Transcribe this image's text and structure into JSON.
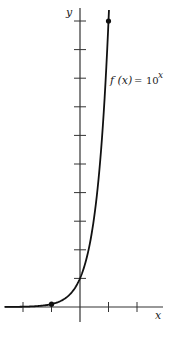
{
  "chart_data": {
    "type": "line",
    "title": "",
    "function_label": "f(x) = 10^x",
    "function_label_parts": {
      "lhs": "f (x)",
      "eq": "=",
      "base": "10",
      "exp": "x"
    },
    "xlabel": "x",
    "ylabel": "y",
    "xlim": [
      -2.6,
      2.9
    ],
    "ylim": [
      -0.5,
      10.5
    ],
    "x_ticks": [
      -2,
      -1,
      1,
      2
    ],
    "y_ticks": [
      1,
      2,
      3,
      4,
      5,
      6,
      7,
      8,
      9,
      10
    ],
    "tick_labels_shown": false,
    "grid": false,
    "legend": "none",
    "series": [
      {
        "name": "f(x) = 10^x",
        "x": [
          -2.6,
          -2,
          -1.5,
          -1,
          -0.5,
          0,
          0.25,
          0.5,
          0.75,
          1,
          1.05
        ],
        "values": [
          0.0025,
          0.01,
          0.032,
          0.1,
          0.316,
          1,
          1.778,
          3.162,
          5.623,
          10,
          11.2
        ]
      }
    ],
    "marked_points": [
      {
        "x": -1,
        "y": 0.1
      },
      {
        "x": 1,
        "y": 10
      }
    ]
  },
  "labels": {
    "x_axis": "x",
    "y_axis": "y",
    "fn_lhs": "f (x)",
    "fn_eq": "=",
    "fn_base": "10",
    "fn_exp": "x"
  }
}
